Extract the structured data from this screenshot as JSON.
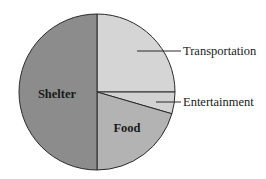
{
  "chart_data": {
    "type": "pie",
    "title": "",
    "slices": [
      {
        "label": "Transportation",
        "value": 25,
        "color": "#d5d5d5",
        "label_position": "outside"
      },
      {
        "label": "Entertainment",
        "value": 4.5,
        "color": "#d2d2d2",
        "label_position": "outside"
      },
      {
        "label": "Food",
        "value": 20.5,
        "color": "#b3b3b3",
        "label_position": "inside"
      },
      {
        "label": "Shelter",
        "value": 50,
        "color": "#8c8c8c",
        "label_position": "inside"
      }
    ],
    "start_angle_deg": 90,
    "direction": "clockwise",
    "legend": "none",
    "units": "percent (estimated from slice angles)"
  }
}
